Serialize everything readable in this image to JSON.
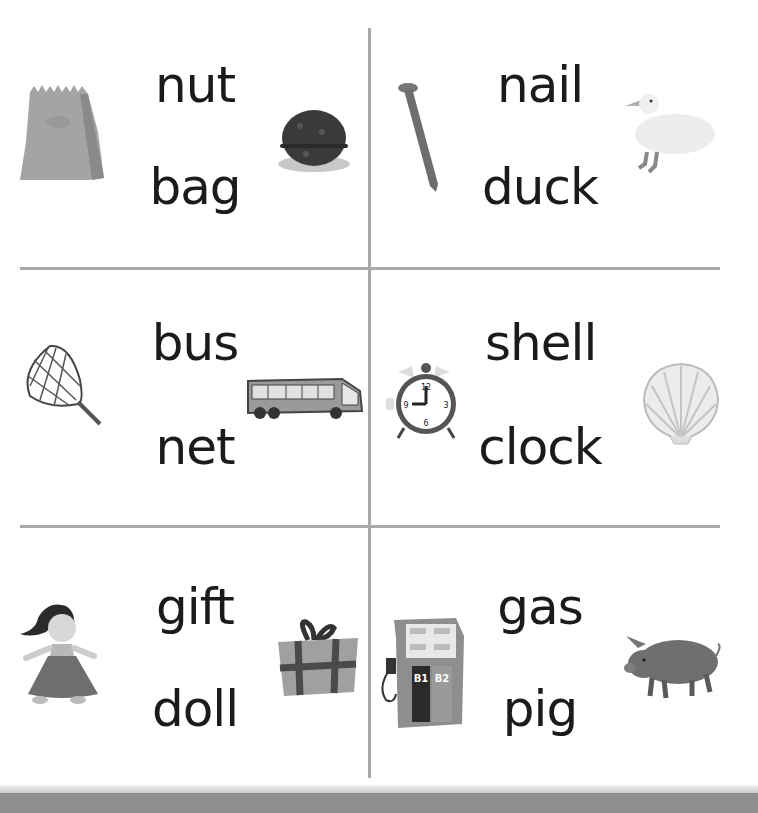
{
  "worksheet": {
    "cells": [
      {
        "position": "top-left",
        "words": [
          "nut",
          "bag"
        ],
        "pictures": [
          "paper-bag",
          "walnut"
        ]
      },
      {
        "position": "top-right",
        "words": [
          "nail",
          "duck"
        ],
        "pictures": [
          "nail",
          "duck"
        ]
      },
      {
        "position": "middle-left",
        "words": [
          "bus",
          "net"
        ],
        "pictures": [
          "butterfly-net",
          "bus"
        ]
      },
      {
        "position": "middle-right",
        "words": [
          "shell",
          "clock"
        ],
        "pictures": [
          "alarm-clock",
          "seashell"
        ]
      },
      {
        "position": "bottom-left",
        "words": [
          "gift",
          "doll"
        ],
        "pictures": [
          "doll",
          "gift-box"
        ]
      },
      {
        "position": "bottom-right",
        "words": [
          "gas",
          "pig"
        ],
        "pictures": [
          "gas-pump",
          "pig"
        ]
      }
    ],
    "gas_pump_labels": [
      "B1",
      "B2"
    ],
    "clock_numbers": [
      "12",
      "1",
      "2",
      "3",
      "4",
      "5",
      "6",
      "7",
      "8",
      "9",
      "10",
      "11"
    ]
  }
}
